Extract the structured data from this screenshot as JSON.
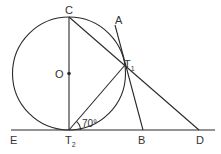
{
  "diagram": {
    "type": "geometry",
    "colors": {
      "stroke": "#2a2a2a",
      "text": "#333333",
      "background": "#ffffff"
    },
    "circle": {
      "center": "O",
      "cx": 69,
      "cy": 73.5,
      "r": 56.5
    },
    "points": {
      "C": {
        "label": "C",
        "x": 69,
        "y": 17
      },
      "O": {
        "label": "O",
        "x": 69,
        "y": 73.5
      },
      "T1": {
        "label": "T",
        "sub": "1",
        "x": 125,
        "y": 65
      },
      "T2": {
        "label": "T",
        "sub": "2",
        "x": 69,
        "y": 130
      },
      "A": {
        "label": "A",
        "x": 115,
        "y": 25
      },
      "B": {
        "label": "B",
        "x": 143,
        "y": 130
      },
      "D": {
        "label": "D",
        "x": 199,
        "y": 130
      },
      "E": {
        "label": "E",
        "x": 11,
        "y": 130
      }
    },
    "segments": [
      {
        "from": "E",
        "to": "end",
        "note": "tangent line ED through T2, B, D"
      },
      {
        "from": "C",
        "to": "T2",
        "note": "diameter through O"
      },
      {
        "from": "C",
        "to": "D"
      },
      {
        "from": "T2",
        "to": "T1"
      },
      {
        "from": "A",
        "to": "B",
        "note": "tangent at T1"
      }
    ],
    "angle": {
      "label": "70°",
      "vertex": "T2",
      "between": [
        "T1",
        "D"
      ]
    }
  }
}
